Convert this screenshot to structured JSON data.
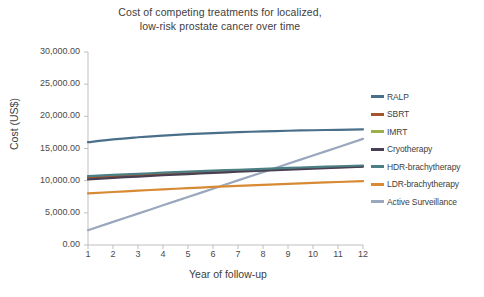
{
  "chart_data": {
    "type": "line",
    "title": "Cost of competing treatments for localized, low-risk prostate cancer over time",
    "title_lines": [
      "Cost of competing treatments for localized,",
      "low-risk prostate cancer over time"
    ],
    "xlabel": "Year of follow-up",
    "ylabel": "Cost  (US$)",
    "x": [
      1,
      2,
      3,
      4,
      5,
      6,
      7,
      8,
      9,
      10,
      11,
      12
    ],
    "categories": [
      "1",
      "2",
      "3",
      "4",
      "5",
      "6",
      "7",
      "8",
      "9",
      "10",
      "11",
      "12"
    ],
    "xlim": [
      1,
      12
    ],
    "ylim": [
      0,
      30000
    ],
    "ytick_values": [
      0,
      5000,
      10000,
      15000,
      20000,
      25000,
      30000
    ],
    "ytick_labels": [
      "0.00",
      "5,000.00",
      "10,000.00",
      "15,000.00",
      "20,000.00",
      "25,000.00",
      "30,000.00"
    ],
    "grid": false,
    "legend_position": "right",
    "series": [
      {
        "name": "RALP",
        "color": "#4a6f8a",
        "values": [
          15980,
          16420,
          16750,
          17010,
          17230,
          17400,
          17540,
          17660,
          17760,
          17840,
          17910,
          17970
        ]
      },
      {
        "name": "SBRT",
        "color": "#a4552c",
        "values": [
          10480,
          10690,
          10880,
          11060,
          11230,
          11390,
          11540,
          11690,
          11830,
          11970,
          12100,
          12230
        ]
      },
      {
        "name": "IMRT",
        "color": "#9bb councils"
      },
      {
        "name": "Cryotherapy",
        "color": "#4a3f52",
        "values": [
          10200,
          10430,
          10640,
          10840,
          11030,
          11210,
          11390,
          11560,
          11720,
          11880,
          12030,
          12180
        ]
      },
      {
        "name": "HDR-brachytherapy",
        "color": "#4b7f84",
        "values": [
          10720,
          10900,
          11070,
          11240,
          11400,
          11550,
          11700,
          11840,
          11980,
          12110,
          12240,
          12360
        ]
      },
      {
        "name": "LDR-brachytherapy",
        "color": "#d78a33",
        "values": [
          8020,
          8240,
          8450,
          8650,
          8840,
          9020,
          9190,
          9350,
          9500,
          9650,
          9790,
          9920
        ]
      },
      {
        "name": "Active Surveillance",
        "color": "#9aa7bd",
        "values": [
          2300,
          3590,
          4880,
          6170,
          7460,
          8750,
          10040,
          11330,
          12620,
          13910,
          15200,
          16490
        ]
      }
    ]
  },
  "legend": {
    "items": [
      {
        "label": "RALP",
        "color": "#4a6f8a"
      },
      {
        "label": "SBRT",
        "color": "#a4552c"
      },
      {
        "label": "IMRT",
        "color": "#9bb04a"
      },
      {
        "label": "Cryotherapy",
        "color": "#4a3f52"
      },
      {
        "label": "HDR-brachytherapy",
        "color": "#4b7f84"
      },
      {
        "label": "LDR-brachytherapy",
        "color": "#d78a33"
      },
      {
        "label": "Active Surveillance",
        "color": "#9aa7bd"
      }
    ]
  },
  "axis": {
    "line_color": "#bfbfbf",
    "tick_color": "#bfbfbf"
  }
}
